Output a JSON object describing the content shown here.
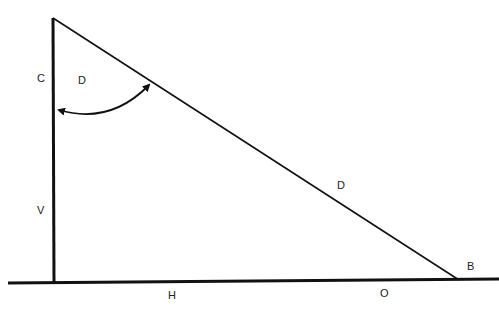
{
  "diagram": {
    "type": "right-triangle",
    "labels": {
      "vertical_side_upper": "C",
      "angle_label": "D",
      "hypotenuse": "D",
      "vertical_side_lower": "V",
      "base_left": "H",
      "base_right": "O",
      "bottom_right_vertex": "B"
    },
    "colors": {
      "stroke": "#111111",
      "text": "#222222",
      "background": "#ffffff"
    }
  }
}
